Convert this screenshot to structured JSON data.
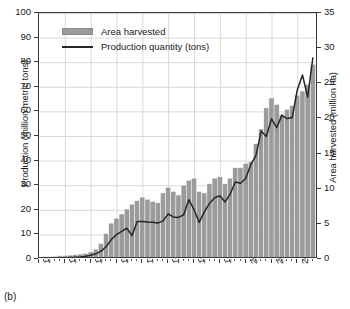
{
  "figure": {
    "caption": "(b)"
  },
  "legend": {
    "position": "top-left-inside",
    "items": [
      {
        "label": "Area harvested",
        "marker": "area-swatch",
        "color": "#9b9b9b"
      },
      {
        "label": "Production quantity (tons)",
        "marker": "line",
        "color": "#262626"
      }
    ]
  },
  "axes": {
    "left": {
      "title": "Production (million metric tons)",
      "ticks": [
        "0",
        "10",
        "20",
        "30",
        "40",
        "50",
        "60",
        "70",
        "80",
        "90",
        "100"
      ],
      "min": 0,
      "max": 100
    },
    "right": {
      "title": "Area harvested (million ha)",
      "ticks": [
        "0",
        "5",
        "10",
        "15",
        "20",
        "25",
        "30",
        "35"
      ],
      "min": 0,
      "max": 35
    },
    "x": {
      "title": "",
      "ticks": [
        "1960",
        "1965",
        "1970",
        "1975",
        "1980",
        "1985",
        "1990",
        "1995",
        "2000",
        "2005",
        "2010"
      ],
      "min": 1960,
      "max": 2014
    }
  },
  "colors": {
    "bars": "#9b9b9b",
    "bar_edge": "#ffffff",
    "line": "#262626",
    "grid": "#d8d8d8",
    "frame": "#3a3a3a",
    "background": "#ffffff"
  },
  "chart_data": {
    "type": "bar",
    "title": "",
    "subtitle": "",
    "xlabel": "",
    "ylabel": "Production (million metric tons)",
    "y2label": "Area harvested (million ha)",
    "xlim": [
      1960,
      2014
    ],
    "ylim": [
      0,
      100
    ],
    "y2lim": [
      0,
      35
    ],
    "grid": true,
    "legend_position": "upper left",
    "x": [
      1961,
      1962,
      1963,
      1964,
      1965,
      1966,
      1967,
      1968,
      1969,
      1970,
      1971,
      1972,
      1973,
      1974,
      1975,
      1976,
      1977,
      1978,
      1979,
      1980,
      1981,
      1982,
      1983,
      1984,
      1985,
      1986,
      1987,
      1988,
      1989,
      1990,
      1991,
      1992,
      1993,
      1994,
      1995,
      1996,
      1997,
      1998,
      1999,
      2000,
      2001,
      2002,
      2003,
      2004,
      2005,
      2006,
      2007,
      2008,
      2009,
      2010,
      2011,
      2012,
      2013
    ],
    "series": [
      {
        "name": "Area harvested",
        "axis": "right",
        "units": "million ha",
        "type": "bar",
        "color": "#9b9b9b",
        "values": [
          0.35,
          0.35,
          0.4,
          0.45,
          0.5,
          0.55,
          0.6,
          0.7,
          0.8,
          1.0,
          1.4,
          2.2,
          3.6,
          5.1,
          5.8,
          6.4,
          7.1,
          7.8,
          8.3,
          8.8,
          8.5,
          8.2,
          8.0,
          9.4,
          10.2,
          9.6,
          9.1,
          10.5,
          11.2,
          11.5,
          9.6,
          9.4,
          10.7,
          11.5,
          11.7,
          10.7,
          11.5,
          13.0,
          13.0,
          13.6,
          13.9,
          16.4,
          18.5,
          21.5,
          22.9,
          22.0,
          20.6,
          21.3,
          21.8,
          23.3,
          23.9,
          24.8,
          27.7
        ]
      },
      {
        "name": "Production quantity (tons)",
        "axis": "left",
        "units": "million metric tons",
        "type": "line",
        "color": "#262626",
        "values": [
          0.3,
          0.3,
          0.4,
          0.4,
          0.5,
          0.6,
          0.7,
          0.8,
          1.1,
          1.5,
          2.1,
          3.2,
          5.0,
          7.9,
          9.9,
          11.2,
          12.5,
          9.5,
          15.2,
          15.2,
          15.0,
          14.9,
          14.6,
          15.5,
          18.3,
          17.1,
          16.9,
          18.0,
          24.1,
          20.1,
          14.9,
          19.2,
          22.6,
          24.9,
          25.7,
          23.2,
          26.4,
          31.3,
          30.8,
          32.7,
          38.4,
          42.1,
          52.0,
          49.8,
          57.0,
          53.4,
          58.4,
          57.1,
          57.5,
          68.8,
          74.8,
          65.8,
          81.7
        ]
      }
    ],
    "note": "Bars read on right axis (million ha); line reads on left axis (million metric tons)."
  }
}
